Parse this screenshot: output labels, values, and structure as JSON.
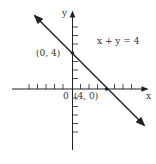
{
  "figure": {
    "equation": "x + y = 4",
    "x_axis_label": "x",
    "y_axis_label": "y",
    "origin_label": "0",
    "points": [
      {
        "label": "(0, 4)",
        "x": 0,
        "y": 4
      },
      {
        "label": "(4, 0)",
        "x": 4,
        "y": 0
      }
    ],
    "line": {
      "slope": -1,
      "intercept": 4
    },
    "colors": {
      "ink": "#222222",
      "background": "#ffffff"
    }
  }
}
